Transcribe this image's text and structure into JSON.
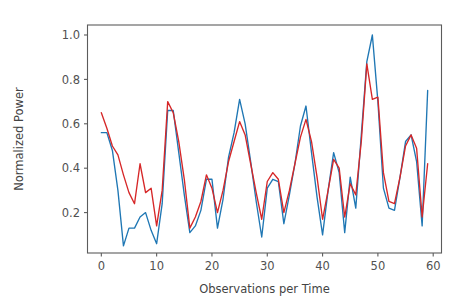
{
  "chart_data": {
    "type": "line",
    "title": "",
    "xlabel": "Observations per Time",
    "ylabel": "Normalized Power",
    "xlim": [
      -2.5,
      61.5
    ],
    "ylim": [
      0.018,
      1.045
    ],
    "xticks": [
      0,
      10,
      20,
      30,
      40,
      50,
      60
    ],
    "xtick_labels": [
      "0",
      "10",
      "20",
      "30",
      "40",
      "50",
      "60"
    ],
    "yticks": [
      0.2,
      0.4,
      0.6,
      0.8,
      1.0
    ],
    "ytick_labels": [
      "0.2",
      "0.4",
      "0.6",
      "0.8",
      "1.0"
    ],
    "grid": false,
    "legend": false,
    "legend_position": "none",
    "x": [
      0,
      1,
      2,
      3,
      4,
      5,
      6,
      7,
      8,
      9,
      10,
      11,
      12,
      13,
      14,
      15,
      16,
      17,
      18,
      19,
      20,
      21,
      22,
      23,
      24,
      25,
      26,
      27,
      28,
      29,
      30,
      31,
      32,
      33,
      34,
      35,
      36,
      37,
      38,
      39,
      40,
      41,
      42,
      43,
      44,
      45,
      46,
      47,
      48,
      49,
      50,
      51,
      52,
      53,
      54,
      55,
      56,
      57,
      58,
      59
    ],
    "series": [
      {
        "name": "series-1",
        "color": "#1f77b4",
        "values": [
          0.56,
          0.56,
          0.48,
          0.3,
          0.05,
          0.13,
          0.13,
          0.18,
          0.2,
          0.12,
          0.06,
          0.24,
          0.66,
          0.66,
          0.47,
          0.28,
          0.11,
          0.14,
          0.21,
          0.35,
          0.35,
          0.13,
          0.26,
          0.45,
          0.56,
          0.71,
          0.6,
          0.43,
          0.25,
          0.09,
          0.31,
          0.35,
          0.34,
          0.15,
          0.28,
          0.42,
          0.59,
          0.68,
          0.47,
          0.27,
          0.1,
          0.3,
          0.47,
          0.38,
          0.11,
          0.36,
          0.22,
          0.55,
          0.88,
          1.0,
          0.7,
          0.31,
          0.22,
          0.21,
          0.36,
          0.52,
          0.55,
          0.43,
          0.14,
          0.75
        ]
      },
      {
        "name": "series-2",
        "color": "#d62728",
        "values": [
          0.65,
          0.58,
          0.5,
          0.46,
          0.37,
          0.29,
          0.24,
          0.42,
          0.29,
          0.31,
          0.14,
          0.3,
          0.7,
          0.65,
          0.52,
          0.35,
          0.13,
          0.18,
          0.25,
          0.37,
          0.31,
          0.2,
          0.3,
          0.43,
          0.52,
          0.61,
          0.55,
          0.42,
          0.29,
          0.17,
          0.34,
          0.38,
          0.35,
          0.2,
          0.3,
          0.42,
          0.54,
          0.62,
          0.52,
          0.36,
          0.17,
          0.3,
          0.44,
          0.4,
          0.18,
          0.33,
          0.28,
          0.52,
          0.87,
          0.71,
          0.72,
          0.38,
          0.25,
          0.24,
          0.36,
          0.5,
          0.55,
          0.49,
          0.18,
          0.42
        ]
      }
    ]
  }
}
